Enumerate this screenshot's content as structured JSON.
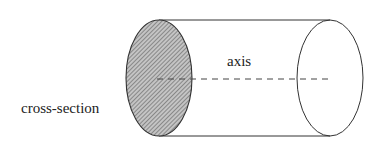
{
  "diagram": {
    "labels": {
      "cross_section": "cross-section",
      "axis": "axis"
    },
    "colors": {
      "stroke": "#333333",
      "hatch_fill": "#9a9a9a",
      "axis_dash": "#444444"
    }
  }
}
